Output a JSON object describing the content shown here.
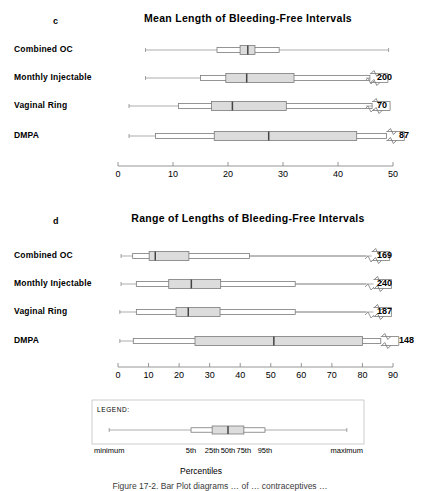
{
  "figure": {
    "caption": "Figure 17-2. Bar Plot diagrams … of … contraceptives …"
  },
  "panels": [
    {
      "letter": "c",
      "title": "Mean Length of Bleeding-Free Intervals",
      "axis": {
        "min": 0,
        "max": 50,
        "ticks": [
          0,
          10,
          20,
          30,
          40,
          50
        ]
      },
      "rows": [
        {
          "label": "Combined OC",
          "tail_label": "",
          "min": 5.0,
          "p5": 18.0,
          "p25": 22.2,
          "p50": 23.6,
          "p75": 24.9,
          "p95": 29.3,
          "max": 49.2,
          "broken": false
        },
        {
          "label": "Monthly Injectable",
          "tail_label": "200",
          "min": 5.0,
          "p5": 15.0,
          "p25": 19.6,
          "p50": 23.4,
          "p75": 32.0,
          "p95": 45.8,
          "max": 45.8,
          "broken": true
        },
        {
          "label": "Vaginal Ring",
          "tail_label": "70",
          "min": 2.0,
          "p5": 11.0,
          "p25": 17.0,
          "p50": 20.8,
          "p75": 30.6,
          "p95": 46.2,
          "max": 46.2,
          "broken": true
        },
        {
          "label": "DMPA",
          "tail_label": "87",
          "min": 2.0,
          "p5": 6.8,
          "p25": 17.5,
          "p50": 27.4,
          "p75": 43.4,
          "p95": 48.8,
          "max": 48.8,
          "broken": true
        }
      ]
    },
    {
      "letter": "d",
      "title": "Range of Lengths of Bleeding-Free Intervals",
      "axis": {
        "min": 0,
        "max": 90,
        "ticks": [
          0,
          10,
          20,
          30,
          40,
          50,
          60,
          70,
          80,
          90
        ]
      },
      "rows": [
        {
          "label": "Combined OC",
          "tail_label": "169",
          "min": 1.0,
          "p5": 4.8,
          "p25": 10.2,
          "p50": 12.2,
          "p75": 23.2,
          "p95": 43.0,
          "max": 83.0,
          "broken": true
        },
        {
          "label": "Monthly Injectable",
          "tail_label": "240",
          "min": 1.0,
          "p5": 6.0,
          "p25": 16.6,
          "p50": 24.0,
          "p75": 33.6,
          "p95": 58.0,
          "max": 83.6,
          "broken": true
        },
        {
          "label": "Vaginal Ring",
          "tail_label": "187",
          "min": 0.6,
          "p5": 6.0,
          "p25": 19.0,
          "p50": 23.0,
          "p75": 33.4,
          "p95": 58.0,
          "max": 83.6,
          "broken": true
        },
        {
          "label": "DMPA",
          "tail_label": "148",
          "min": 0.6,
          "p5": 5.0,
          "p25": 25.2,
          "p50": 51.0,
          "p75": 80.0,
          "p95": 86.0,
          "max": 86.0,
          "broken": true
        }
      ]
    }
  ],
  "legend": {
    "heading": "LEGEND:",
    "axis_caption": "Percentiles",
    "markers": [
      {
        "text": "minimum",
        "value": 5
      },
      {
        "text": "5th",
        "value": 36
      },
      {
        "text": "25th",
        "value": 44
      },
      {
        "text": "50th",
        "value": 50
      },
      {
        "text": "75th",
        "value": 56
      },
      {
        "text": "95th",
        "value": 64
      },
      {
        "text": "maximum",
        "value": 95
      }
    ],
    "box": {
      "min": 5,
      "p5": 36,
      "p25": 44,
      "p50": 50,
      "p75": 56,
      "p95": 64,
      "max": 95
    }
  },
  "colors": {
    "line": "#8a8a8a",
    "stroke": "#7a7a7a",
    "median": "#444444",
    "fill_inner": "#dcdcdc",
    "fill_outer": "#ffffff",
    "text": "#000000"
  },
  "chart_data": {
    "type": "boxplot",
    "charts": [
      {
        "panel": "c",
        "title": "Mean Length of Bleeding-Free Intervals",
        "xlabel": "",
        "xlim": [
          0,
          50
        ],
        "xticks": [
          0,
          10,
          20,
          30,
          40,
          50
        ],
        "grid": false,
        "categories": [
          "Combined OC",
          "Monthly Injectable",
          "Vaginal Ring",
          "DMPA"
        ],
        "series": [
          {
            "name": "minimum",
            "values": [
              5.0,
              5.0,
              2.0,
              2.0
            ]
          },
          {
            "name": "5th",
            "values": [
              18.0,
              15.0,
              11.0,
              6.8
            ]
          },
          {
            "name": "25th",
            "values": [
              22.2,
              19.6,
              17.0,
              17.5
            ]
          },
          {
            "name": "50th",
            "values": [
              23.6,
              23.4,
              20.8,
              27.4
            ]
          },
          {
            "name": "75th",
            "values": [
              24.9,
              32.0,
              30.6,
              43.4
            ]
          },
          {
            "name": "95th",
            "values": [
              29.3,
              45.8,
              46.2,
              48.8
            ]
          },
          {
            "name": "maximum",
            "values": [
              49.2,
              200,
              70,
              87
            ]
          }
        ],
        "annotations": [
          "200",
          "70",
          "87"
        ]
      },
      {
        "panel": "d",
        "title": "Range of Lengths of Bleeding-Free Intervals",
        "xlabel": "",
        "xlim": [
          0,
          90
        ],
        "xticks": [
          0,
          10,
          20,
          30,
          40,
          50,
          60,
          70,
          80,
          90
        ],
        "grid": false,
        "categories": [
          "Combined OC",
          "Monthly Injectable",
          "Vaginal Ring",
          "DMPA"
        ],
        "series": [
          {
            "name": "minimum",
            "values": [
              1.0,
              1.0,
              0.6,
              0.6
            ]
          },
          {
            "name": "5th",
            "values": [
              4.8,
              6.0,
              6.0,
              5.0
            ]
          },
          {
            "name": "25th",
            "values": [
              10.2,
              16.6,
              19.0,
              25.2
            ]
          },
          {
            "name": "50th",
            "values": [
              12.2,
              24.0,
              23.0,
              51.0
            ]
          },
          {
            "name": "75th",
            "values": [
              23.2,
              33.6,
              33.4,
              80.0
            ]
          },
          {
            "name": "95th",
            "values": [
              43.0,
              58.0,
              58.0,
              86.0
            ]
          },
          {
            "name": "maximum",
            "values": [
              169,
              240,
              187,
              148
            ]
          }
        ],
        "annotations": [
          "169",
          "240",
          "187",
          "148"
        ]
      }
    ],
    "legend_position": "bottom",
    "legend_entries": [
      "minimum",
      "5th",
      "25th",
      "50th",
      "75th",
      "95th",
      "maximum"
    ]
  }
}
